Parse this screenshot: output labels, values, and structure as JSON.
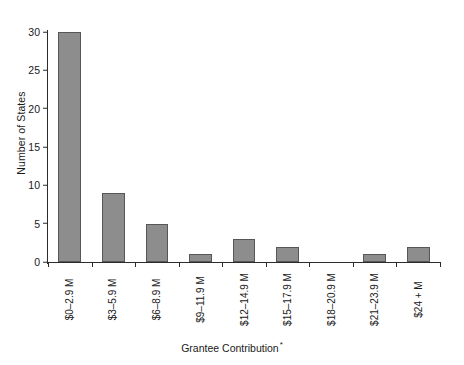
{
  "chart_data": {
    "type": "bar",
    "title": "",
    "xlabel": "Grantee Contribution",
    "xlabel_footnote": "*",
    "ylabel": "Number of States",
    "categories": [
      "$0–2.9 M",
      "$3–5.9 M",
      "$6–8.9 M",
      "$9–11.9 M",
      "$12–14.9 M",
      "$15–17.9 M",
      "$18–20.9 M",
      "$21–23.9 M",
      "$24 + M"
    ],
    "values": [
      30,
      9,
      5,
      1,
      3,
      2,
      0,
      1,
      2
    ],
    "ylim": [
      0,
      30
    ],
    "yticks": [
      0,
      5,
      10,
      15,
      20,
      25,
      30
    ],
    "ytick_labels": [
      "0",
      "5",
      "10",
      "15",
      "20",
      "25",
      "30"
    ],
    "grid": false,
    "legend": false,
    "bar_color": "#8d8d8d",
    "bar_edge_color": "#575757",
    "axis_color": "#2b2b2b",
    "background_color": "#ffffff"
  }
}
